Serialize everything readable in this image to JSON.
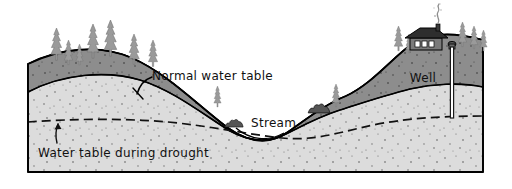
{
  "figure": {
    "kind": "geology-cross-section-diagram",
    "title_visible": false,
    "background_color": "#ffffff"
  },
  "labels": {
    "normal_water_table": "Normal water table",
    "stream": "Stream",
    "drought_water_table": "Water table during drought",
    "well": "Well"
  },
  "colors": {
    "unsaturated_zone": "#8d8d8d",
    "saturated_zone": "#d9d9d9",
    "outline": "#000000",
    "tree": "#9a9a9a",
    "tree_dark": "#6f6f6f",
    "house_roof": "#2e2e2e",
    "house_wall": "#7a7a7a",
    "window": "#ffffff",
    "well_pipe": "#4a4a4a",
    "smoke": "#b5b5b5",
    "speckle": "#5a5a5a",
    "background": "#ffffff"
  },
  "block": {
    "left_x": 28,
    "right_x": 483,
    "bottom_y": 172,
    "top_surface_description": "hill on left, valley with stream in center, high ridge on right"
  },
  "features": {
    "left_hill_trees": 7,
    "valley_shrubs": 2,
    "right_ridge_trees": 5,
    "mid_valley_trees": 2,
    "house_windows": 3,
    "chimney_smoke_puffs": 4,
    "well_count": 1
  },
  "annotations": {
    "drought_arrow": "upward arrow pointing to dashed drought water table line",
    "normal_leader": "leader line from label hooking to normal water table boundary"
  }
}
